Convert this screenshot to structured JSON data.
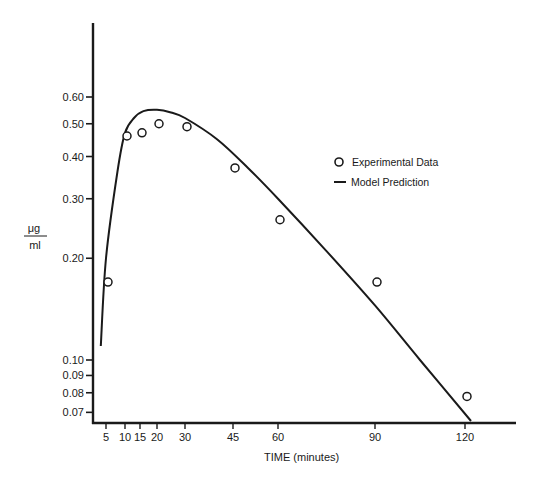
{
  "chart_data": {
    "type": "line",
    "title": "",
    "xlabel": "TIME (minutes)",
    "ylabel": "μg / ml",
    "ylabel_numerator": "μg",
    "ylabel_denominator": "ml",
    "yscale": "log",
    "xlim": [
      0,
      130
    ],
    "ylim": [
      0.065,
      1.0
    ],
    "grid": false,
    "legend_position": "upper right",
    "x_ticks": [
      5,
      10,
      15,
      20,
      30,
      45,
      60,
      90,
      120
    ],
    "x_tick_labels": [
      "5",
      "10",
      "15",
      "20",
      "30",
      "45",
      "60",
      "90",
      "120"
    ],
    "y_ticks": [
      0.07,
      0.08,
      0.09,
      0.1,
      0.2,
      0.3,
      0.4,
      0.5,
      0.6
    ],
    "y_tick_labels": [
      "0.07",
      "0.08",
      "0.09",
      "0.10",
      "0.20",
      "0.30",
      "0.40",
      "0.50",
      "0.60"
    ],
    "series": [
      {
        "name": "Experimental Data",
        "style": "open-circle-markers",
        "x": [
          5,
          10,
          15,
          20,
          30,
          45,
          60,
          90,
          120
        ],
        "y": [
          0.17,
          0.46,
          0.47,
          0.5,
          0.49,
          0.37,
          0.26,
          0.17,
          0.078
        ]
      },
      {
        "name": "Model Prediction",
        "style": "solid-line",
        "x": [
          3,
          5,
          8,
          10,
          13,
          16,
          20,
          25,
          30,
          40,
          50,
          60,
          75,
          90,
          105,
          122
        ],
        "y": [
          0.11,
          0.2,
          0.36,
          0.47,
          0.52,
          0.545,
          0.55,
          0.54,
          0.52,
          0.45,
          0.37,
          0.3,
          0.21,
          0.145,
          0.1,
          0.066
        ]
      }
    ]
  },
  "legend": {
    "items": [
      {
        "label": "Experimental Data",
        "symbol": "open-circle"
      },
      {
        "label": "Model Prediction",
        "symbol": "line"
      }
    ]
  },
  "colors": {
    "ink": "#1a1a1a",
    "background": "#ffffff"
  }
}
